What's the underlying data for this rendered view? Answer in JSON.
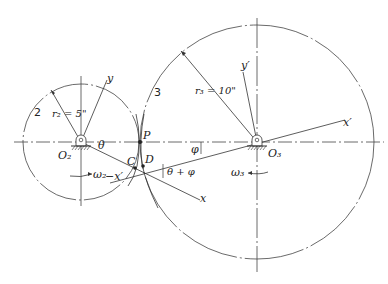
{
  "diagram": {
    "gear2": {
      "number_label": "2",
      "radius_label": "r₂ = 5\"",
      "center_label": "O₂",
      "omega_label": "ω₂",
      "center": [
        81,
        142
      ],
      "radius": 58
    },
    "gear3": {
      "number_label": "3",
      "radius_label": "r₃ = 10\"",
      "center_label": "O₃",
      "omega_label": "ω₃",
      "center": [
        257,
        142
      ],
      "radius": 117
    },
    "points": {
      "P": "P",
      "C": "C",
      "D": "D"
    },
    "axes": {
      "y": "y",
      "x": "x",
      "x_prime_neg": "−x′",
      "y_prime": "y′",
      "x_prime": "x′"
    },
    "angles": {
      "theta": "θ",
      "phi": "φ",
      "theta_plus_phi": "θ + φ"
    },
    "colors": {
      "line": "#333333",
      "background": "#ffffff"
    }
  }
}
